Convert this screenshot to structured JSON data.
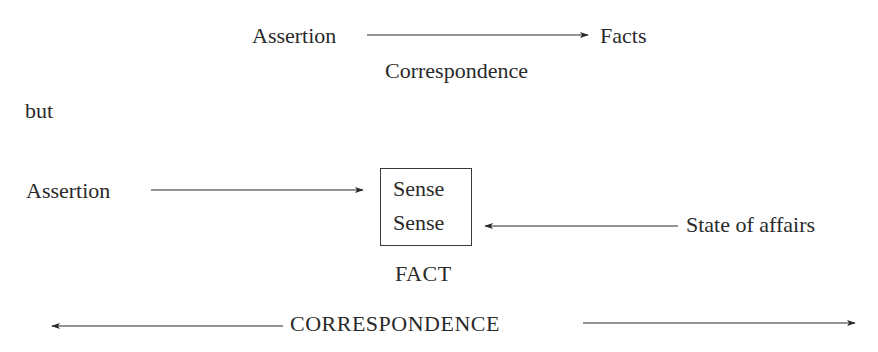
{
  "top_diagram": {
    "source": "Assertion",
    "target": "Facts",
    "relation": "Correspondence"
  },
  "connector": "but",
  "bottom_diagram": {
    "source": "Assertion",
    "box_lines": [
      "Sense",
      "Sense"
    ],
    "box_label": "FACT",
    "right_source": "State of affairs",
    "relation": "CORRESPONDENCE"
  },
  "colors": {
    "ink": "#2a2a2a",
    "background": "#ffffff"
  }
}
